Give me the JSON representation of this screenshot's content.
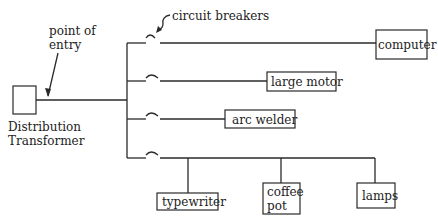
{
  "diagram": {
    "source": {
      "label_line1": "Distribution",
      "label_line2": "Transformer"
    },
    "annotations": {
      "point_of_entry_line1": "point of",
      "point_of_entry_line2": "entry",
      "circuit_breakers": "circuit breakers"
    },
    "loads": {
      "computer": "computer",
      "large_motor": "large motor",
      "arc_welder": "arc welder",
      "typewriter": "typewriter",
      "coffee_pot_line1": "coffee",
      "coffee_pot_line2": "pot",
      "lamps": "lamps"
    },
    "branches": [
      {
        "name": "branch-1",
        "loads": [
          "computer"
        ]
      },
      {
        "name": "branch-2",
        "loads": [
          "large motor"
        ]
      },
      {
        "name": "branch-3",
        "loads": [
          "arc welder"
        ]
      },
      {
        "name": "branch-4",
        "loads": [
          "typewriter",
          "coffee pot",
          "lamps"
        ]
      }
    ],
    "colors": {
      "line": "#2a2a2a",
      "background": "#ffffff"
    }
  }
}
